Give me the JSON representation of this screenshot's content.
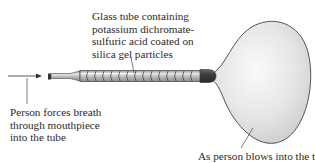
{
  "figure": {
    "labels": {
      "tube": [
        "Glass tube containing",
        "potassium dichromate-",
        "sulfuric acid coated on",
        "silica gel particles"
      ],
      "breath": [
        "Person forces breath",
        "through mouthpiece",
        "into the tube"
      ],
      "bag": [
        "As person blows into the tube,"
      ]
    },
    "components": [
      {
        "name": "mouthpiece",
        "type": "tube-nozzle"
      },
      {
        "name": "glass-tube",
        "type": "segmented-tube",
        "segments": 14
      },
      {
        "name": "connector-cap",
        "type": "cap"
      },
      {
        "name": "collection-bag",
        "type": "balloon"
      }
    ],
    "colors": {
      "line": "#333333",
      "tube_fill": "#b8b8b8",
      "tube_highlight": "#f2f2f2",
      "bag_fill": "#e4e4e4",
      "cap_fill": "#4a4a4a"
    }
  }
}
